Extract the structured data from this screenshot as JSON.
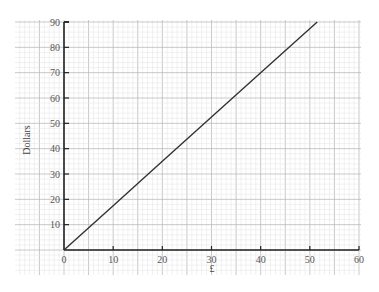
{
  "chart_data": {
    "type": "line",
    "title": "",
    "xlabel": "£",
    "ylabel": "Dollars",
    "xlim": [
      0,
      60
    ],
    "ylim": [
      0,
      90
    ],
    "x_ticks": [
      0,
      10,
      20,
      30,
      40,
      50,
      60
    ],
    "y_ticks": [
      10,
      20,
      30,
      40,
      50,
      60,
      70,
      80,
      90
    ],
    "grid": true,
    "legend": null,
    "series": [
      {
        "name": "conversion",
        "x": [
          0,
          10,
          20,
          30,
          40,
          51.5
        ],
        "y": [
          0,
          17.5,
          35,
          52.5,
          70,
          90
        ]
      }
    ],
    "colors": {
      "line": "#333333",
      "axis": "#222222",
      "grid_major": "#bbbbbb",
      "grid_minor": "#e2e2e2"
    }
  }
}
